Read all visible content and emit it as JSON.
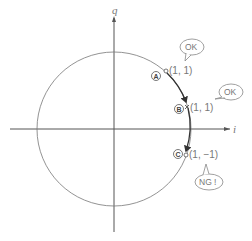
{
  "axes": {
    "horizontal_label": "i",
    "vertical_label": "q"
  },
  "points": [
    {
      "id": "A",
      "badge": "A",
      "coord": "(1,  1)",
      "marker": "circle",
      "callout": "OK"
    },
    {
      "id": "B",
      "badge": "B",
      "coord": "(1,  1)",
      "marker": "cross",
      "callout": "OK"
    },
    {
      "id": "C",
      "badge": "C",
      "coord": "(1,  −1)",
      "marker": "circle",
      "callout": "NG !"
    }
  ],
  "colors": {
    "line": "#555555",
    "text": "#777777"
  }
}
